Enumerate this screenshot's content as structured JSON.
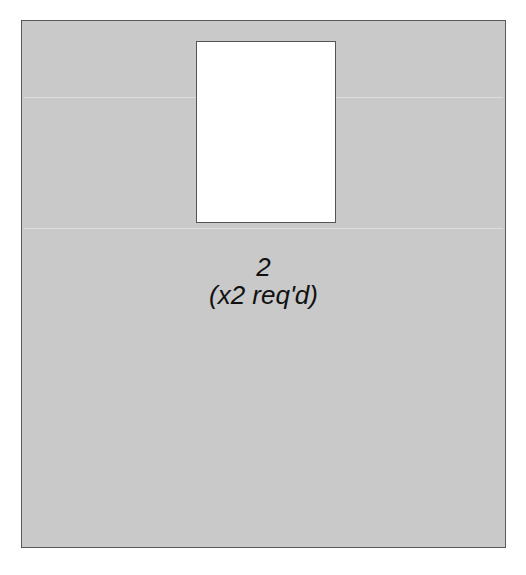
{
  "diagram": {
    "part_number": "2",
    "quantity_note": "(x2 req'd)",
    "colors": {
      "panel": "#c9c9c9",
      "cutout": "#ffffff",
      "outline": "#5a5a5a",
      "text": "#111111"
    }
  }
}
